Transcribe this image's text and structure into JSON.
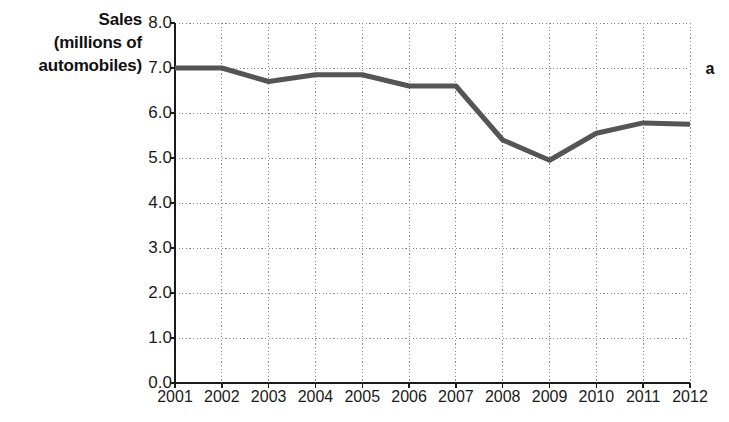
{
  "chart_data": {
    "type": "line",
    "title": "",
    "subtitle": "",
    "xlabel": "",
    "ylabel": "Sales (millions of automobiles)",
    "ylabel_lines": [
      "Sales",
      "(millions of",
      "automobiles)"
    ],
    "categories": [
      "2001",
      "2002",
      "2003",
      "2004",
      "2005",
      "2006",
      "2007",
      "2008",
      "2009",
      "2010",
      "2011",
      "2012"
    ],
    "x": [
      2001,
      2002,
      2003,
      2004,
      2005,
      2006,
      2007,
      2008,
      2009,
      2010,
      2011,
      2012
    ],
    "values": [
      7.0,
      7.0,
      6.7,
      6.85,
      6.85,
      6.6,
      6.6,
      5.4,
      4.95,
      5.55,
      5.78,
      5.75
    ],
    "series": [
      {
        "name": "Sales",
        "values": [
          7.0,
          7.0,
          6.7,
          6.85,
          6.85,
          6.6,
          6.6,
          5.4,
          4.95,
          5.55,
          5.78,
          5.75
        ]
      }
    ],
    "ylim": [
      0.0,
      8.0
    ],
    "ytick_values": [
      0.0,
      1.0,
      2.0,
      3.0,
      4.0,
      5.0,
      6.0,
      7.0,
      8.0
    ],
    "ytick_labels": [
      "0.0",
      "1.0",
      "2.0",
      "3.0",
      "4.0",
      "5.0",
      "6.0",
      "7.0",
      "8.0"
    ],
    "grid": true,
    "grid_style": "dotted",
    "legend": false,
    "legend_position": "none",
    "line_color": "#555555",
    "grid_color": "#8a8a8a",
    "axis_color": "#1a1a1a",
    "annotations": [
      {
        "text": "a",
        "position": "top-right-outside"
      }
    ]
  },
  "panel": {
    "label": "a"
  }
}
